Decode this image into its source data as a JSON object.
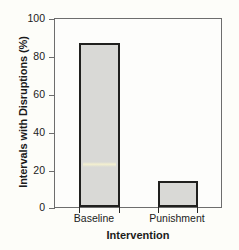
{
  "chart_data": {
    "type": "bar",
    "title": "",
    "categories": [
      "Baseline",
      "Punishment"
    ],
    "values": [
      87,
      14
    ],
    "series": [
      {
        "name": "Intervals with Disruptions",
        "values": [
          87,
          14
        ]
      }
    ],
    "xlabel": "Intervention",
    "ylabel": "Intervals with Disruptions (%)",
    "ylim": [
      0,
      100
    ],
    "yticks": [
      0,
      20,
      40,
      60,
      80,
      100
    ],
    "ytick_labels": [
      "0",
      "20",
      "40",
      "60",
      "80",
      "100"
    ],
    "grid": false,
    "legend": false,
    "legend_position": "none",
    "colors": {
      "bar_fill": "#d9d9d6",
      "bar_edge": "#20201e",
      "axis": "#6d6d6d",
      "text": "#1b1b1b",
      "background": "#fdfdf9"
    }
  },
  "axes": {
    "y": {
      "title": "Intervals with Disruptions (%)",
      "ticks": [
        {
          "value": 100,
          "label": "100"
        },
        {
          "value": 80,
          "label": "80"
        },
        {
          "value": 60,
          "label": "60"
        },
        {
          "value": 40,
          "label": "40"
        },
        {
          "value": 20,
          "label": "20"
        },
        {
          "value": 0,
          "label": "0"
        }
      ]
    },
    "x": {
      "title": "Intervention",
      "ticks": [
        {
          "label": "Baseline"
        },
        {
          "label": "Punishment"
        }
      ]
    }
  },
  "bars": [
    {
      "category": "Baseline",
      "value": 87,
      "value_label": "87"
    },
    {
      "category": "Punishment",
      "value": 14,
      "value_label": "14"
    }
  ]
}
